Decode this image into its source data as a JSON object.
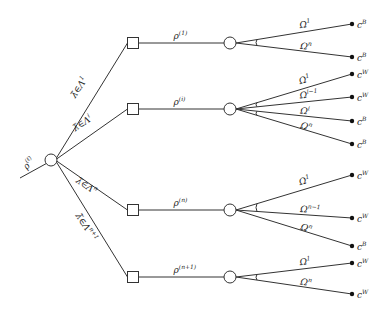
{
  "diagram": {
    "type": "tree",
    "root": {
      "label": "ρ",
      "label_sup": "(ℓ)",
      "incoming_from": [
        20,
        178
      ],
      "center": [
        51,
        160
      ]
    },
    "branches": [
      {
        "edge_label": "λ̃∈Λ",
        "edge_label_sup": "1",
        "square": [
          133,
          43
        ],
        "state_label": "ρ",
        "state_label_sup": "(1)",
        "circle": [
          230,
          43
        ],
        "leaves": [
          {
            "omega": "Ω",
            "omega_sup": "1",
            "y": 24,
            "outcome": "c",
            "outcome_sup": "B"
          },
          {
            "omega": "Ω",
            "omega_sup": "n",
            "y": 57,
            "outcome": "c",
            "outcome_sup": "B"
          }
        ],
        "ties": [
          [
            0,
            1
          ]
        ]
      },
      {
        "edge_label": "λ̃∈Λ",
        "edge_label_sup": "i",
        "square": [
          133,
          109
        ],
        "state_label": "ρ",
        "state_label_sup": "(i)",
        "circle": [
          230,
          109
        ],
        "leaves": [
          {
            "omega": "Ω",
            "omega_sup": "1",
            "y": 74,
            "outcome": "c",
            "outcome_sup": "W"
          },
          {
            "omega": "Ω",
            "omega_sup": "i−1",
            "y": 97,
            "outcome": "c",
            "outcome_sup": "W"
          },
          {
            "omega": "Ω",
            "omega_sup": "i",
            "y": 121,
            "outcome": "c",
            "outcome_sup": "B"
          },
          {
            "omega": "Ω",
            "omega_sup": "n",
            "y": 144,
            "outcome": "c",
            "outcome_sup": "B"
          }
        ],
        "ties": [
          [
            0,
            1
          ],
          [
            2,
            3
          ]
        ]
      },
      {
        "edge_label": "λ̃∈Λ",
        "edge_label_sup": "n",
        "square": [
          133,
          210
        ],
        "state_label": "ρ",
        "state_label_sup": "(n)",
        "circle": [
          230,
          210
        ],
        "leaves": [
          {
            "omega": "Ω",
            "omega_sup": "1",
            "y": 175,
            "outcome": "c",
            "outcome_sup": "W"
          },
          {
            "omega": "Ω",
            "omega_sup": "n−1",
            "y": 218,
            "outcome": "c",
            "outcome_sup": "W"
          },
          {
            "omega": "Ω",
            "omega_sup": "n",
            "y": 246,
            "outcome": "c",
            "outcome_sup": "B"
          }
        ],
        "ties": [
          [
            0,
            1
          ]
        ]
      },
      {
        "edge_label": "λ̃∈Λ",
        "edge_label_sup": "n+1",
        "square": [
          133,
          277
        ],
        "state_label": "ρ",
        "state_label_sup": "(n+1)",
        "circle": [
          230,
          277
        ],
        "leaves": [
          {
            "omega": "Ω",
            "omega_sup": "1",
            "y": 263,
            "outcome": "c",
            "outcome_sup": "W"
          },
          {
            "omega": "Ω",
            "omega_sup": "n",
            "y": 294,
            "outcome": "c",
            "outcome_sup": "W"
          }
        ],
        "ties": [
          [
            0,
            1
          ]
        ]
      }
    ],
    "leaf_x": 352,
    "colors": {
      "line": "#333333",
      "leaf_dot": "#111111",
      "background": "#ffffff"
    }
  }
}
